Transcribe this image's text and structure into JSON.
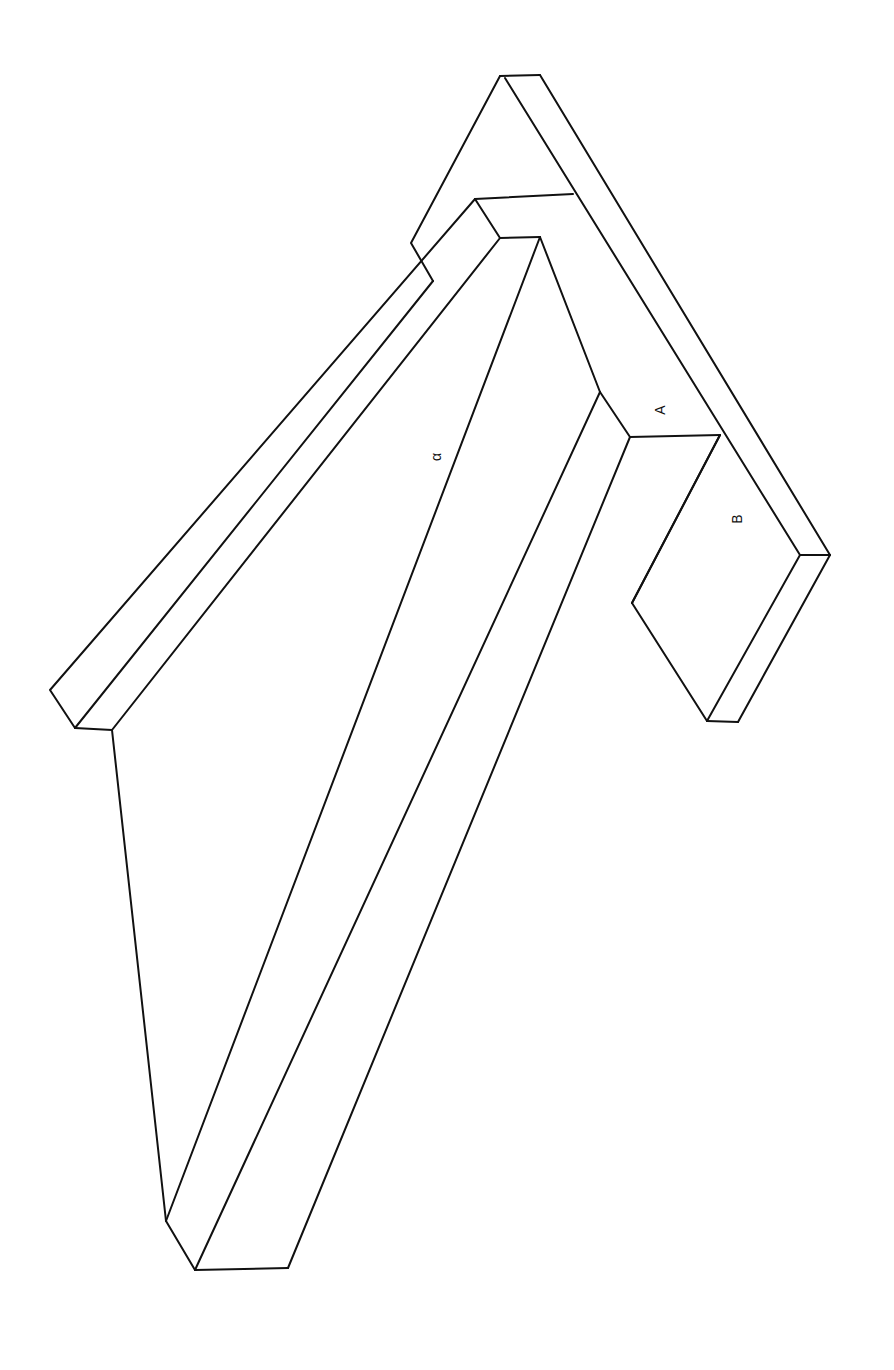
{
  "diagram": {
    "title": "",
    "stroke_color": "#111111",
    "background": "#ffffff",
    "labels": [
      {
        "id": "A",
        "text": "A",
        "x": 661,
        "y": 410,
        "rotate": -90
      },
      {
        "id": "B",
        "text": "B",
        "x": 738,
        "y": 519,
        "rotate": -90
      },
      {
        "id": "alpha",
        "text": "α",
        "x": 437,
        "y": 457,
        "rotate": -90
      }
    ],
    "edges": [
      {
        "name": "top-flange-top-edge",
        "points": [
          [
            500,
            76
          ],
          [
            540,
            75
          ]
        ]
      },
      {
        "name": "top-flange-left-slope",
        "points": [
          [
            500,
            76
          ],
          [
            411,
            243
          ],
          [
            433,
            281
          ]
        ]
      },
      {
        "name": "top-flange-right-outer",
        "points": [
          [
            540,
            75
          ],
          [
            830,
            555
          ]
        ]
      },
      {
        "name": "top-flange-right-inner",
        "points": [
          [
            505,
            78
          ],
          [
            800,
            555
          ]
        ]
      },
      {
        "name": "flange-front-bottom",
        "points": [
          [
            800,
            555
          ],
          [
            830,
            555
          ]
        ]
      },
      {
        "name": "flange-front-right",
        "points": [
          [
            830,
            555
          ],
          [
            738,
            722
          ]
        ]
      },
      {
        "name": "flange-front-left",
        "points": [
          [
            800,
            555
          ],
          [
            707,
            721
          ]
        ]
      },
      {
        "name": "flange-front-base",
        "points": [
          [
            707,
            721
          ],
          [
            738,
            722
          ]
        ]
      },
      {
        "name": "flange-step",
        "points": [
          [
            475,
            199
          ],
          [
            573,
            194
          ]
        ]
      },
      {
        "name": "web-upper-left",
        "points": [
          [
            475,
            199
          ],
          [
            500,
            238
          ]
        ]
      },
      {
        "name": "web-upper-top",
        "points": [
          [
            500,
            238
          ],
          [
            540,
            237
          ]
        ]
      },
      {
        "name": "web-upper-slope",
        "points": [
          [
            540,
            237
          ],
          [
            600,
            392
          ],
          [
            630,
            437
          ]
        ]
      },
      {
        "name": "ledge-A",
        "points": [
          [
            630,
            437
          ],
          [
            720,
            435
          ]
        ]
      },
      {
        "name": "block-B-left",
        "points": [
          [
            720,
            435
          ],
          [
            632,
            603
          ]
        ]
      },
      {
        "name": "block-B-diag",
        "points": [
          [
            632,
            603
          ],
          [
            707,
            721
          ]
        ]
      },
      {
        "name": "left-rail-outer",
        "points": [
          [
            475,
            199
          ],
          [
            50,
            690
          ],
          [
            75,
            728
          ]
        ]
      },
      {
        "name": "left-rail-inner",
        "points": [
          [
            433,
            281
          ],
          [
            75,
            728
          ]
        ]
      },
      {
        "name": "left-rail-2",
        "points": [
          [
            500,
            238
          ],
          [
            112,
            730
          ]
        ]
      },
      {
        "name": "left-rail-foot",
        "points": [
          [
            75,
            728
          ],
          [
            112,
            730
          ]
        ]
      },
      {
        "name": "mid-rail",
        "points": [
          [
            540,
            237
          ],
          [
            166,
            1221
          ]
        ]
      },
      {
        "name": "inner-rail",
        "points": [
          [
            600,
            392
          ],
          [
            195,
            1270
          ]
        ]
      },
      {
        "name": "front-rail",
        "points": [
          [
            630,
            437
          ],
          [
            288,
            1268
          ]
        ]
      },
      {
        "name": "right-rail",
        "points": [
          [
            720,
            435
          ],
          [
            632,
            603
          ]
        ]
      },
      {
        "name": "bottom-slope",
        "points": [
          [
            112,
            730
          ],
          [
            166,
            1221
          ],
          [
            195,
            1270
          ]
        ]
      },
      {
        "name": "bottom-base",
        "points": [
          [
            195,
            1270
          ],
          [
            288,
            1268
          ]
        ]
      }
    ]
  }
}
